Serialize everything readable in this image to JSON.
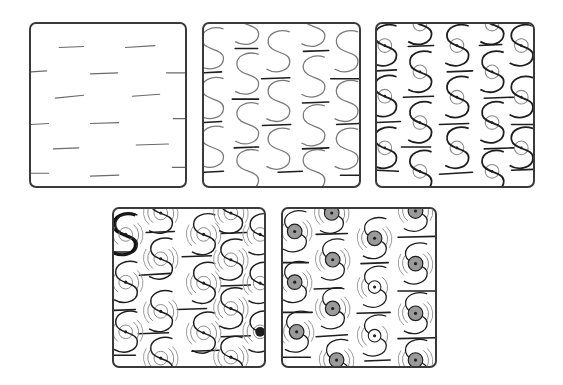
{
  "diagram": {
    "type": "step-out",
    "colors": {
      "border": "#3a3a3a",
      "guide_line": "#6a6a6a",
      "s_curve": "#7a7a7a",
      "s_curve_dark": "#1e1e1e",
      "ring": "#8a8a8a",
      "shade": "#9a9a9a",
      "background": "#ffffff"
    },
    "steps": [
      {
        "id": 1,
        "label": "Step 1",
        "description": "Offset rows of short horizontal dashes"
      },
      {
        "id": 2,
        "label": "Step 2",
        "description": "S-curves drawn between the dashes"
      },
      {
        "id": 3,
        "label": "Step 3",
        "description": "S-curves darkened, a small circle drawn at each S center"
      },
      {
        "id": 4,
        "label": "Step 4",
        "description": "Arc echo lines added around each circle"
      },
      {
        "id": 5,
        "label": "Step 5",
        "description": "Circles shaded gray with a center dot"
      }
    ]
  }
}
